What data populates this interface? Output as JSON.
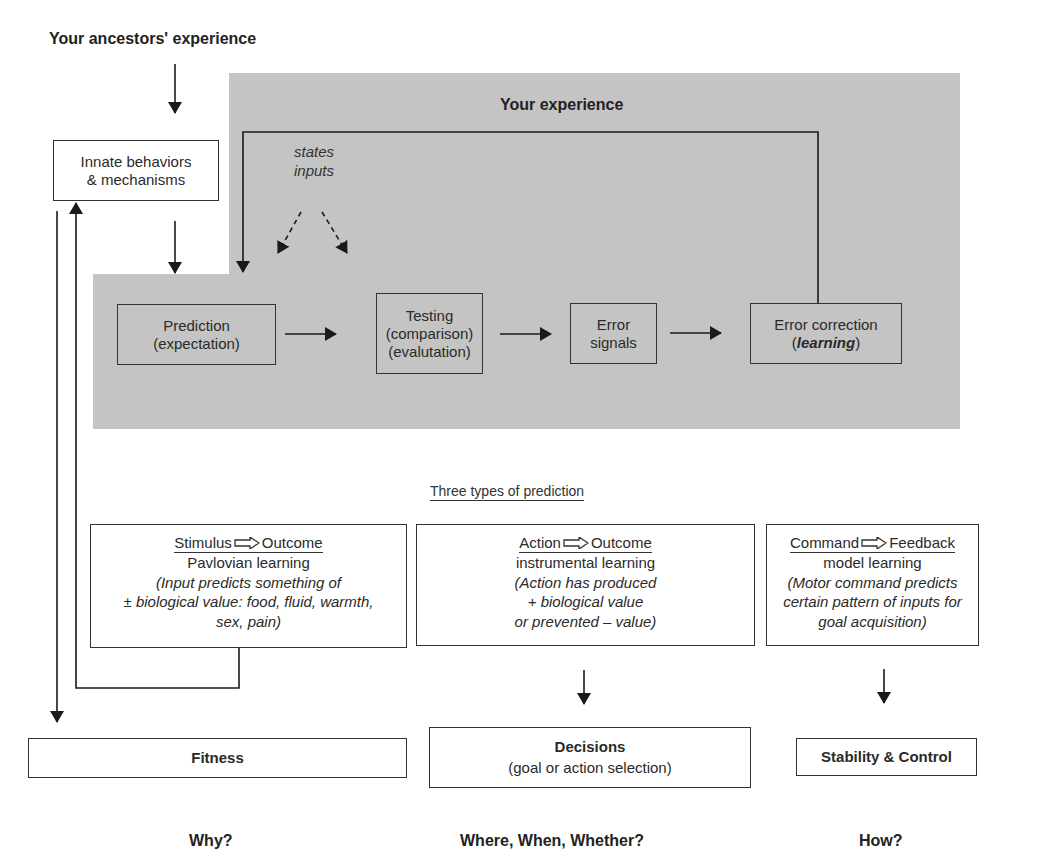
{
  "diagram": {
    "top_label": "Your ancestors' experience",
    "experience_region": {
      "title": "Your experience",
      "fill_color": "#c4c4c4",
      "modulators": {
        "line1": "states",
        "line2": "inputs"
      }
    },
    "innate_box": {
      "line1": "Innate behaviors",
      "line2": "& mechanisms"
    },
    "loop": {
      "prediction": {
        "line1": "Prediction",
        "line2": "(expectation)"
      },
      "testing": {
        "line1": "Testing",
        "line2": "(comparison)",
        "line3": "(evalutation)"
      },
      "error_signals": {
        "line1": "Error",
        "line2": "signals"
      },
      "error_correction": {
        "line1": "Error correction",
        "line2_prefix": "(",
        "line2_emph": "learning",
        "line2_suffix": ")"
      }
    },
    "prediction_types": {
      "heading": "Three types of prediction",
      "types": [
        {
          "from": "Stimulus",
          "to": "Outcome",
          "kind": "Pavlovian learning",
          "desc_lines": [
            "(Input predicts something of",
            "± biological value: food, fluid, warmth,",
            "sex, pain)"
          ]
        },
        {
          "from": "Action",
          "to": "Outcome",
          "kind": "instrumental learning",
          "desc_lines": [
            "(Action has produced",
            "+ biological value",
            "or prevented – value)"
          ]
        },
        {
          "from": "Command",
          "to": "Feedback",
          "kind": "model learning",
          "desc_lines": [
            "(Motor command predicts",
            "certain pattern of inputs for",
            "goal acquisition)"
          ]
        }
      ]
    },
    "outcomes": [
      {
        "title": "Fitness",
        "subtitle": "",
        "question": "Why?"
      },
      {
        "title": "Decisions",
        "subtitle": "(goal or action selection)",
        "question": "Where, When, Whether?"
      },
      {
        "title": "Stability & Control",
        "subtitle": "",
        "question": "How?"
      }
    ]
  }
}
